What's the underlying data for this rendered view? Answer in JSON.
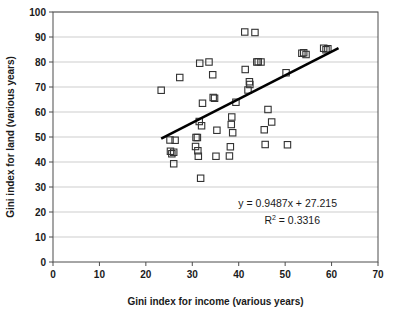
{
  "chart_data": {
    "type": "scatter",
    "title": "",
    "xlabel": "Gini index for income (various years)",
    "ylabel": "Gini index for land (various years)",
    "xlim": [
      0,
      70
    ],
    "ylim": [
      0,
      100
    ],
    "xticks": [
      0,
      10,
      20,
      30,
      40,
      50,
      60,
      70
    ],
    "yticks": [
      0,
      10,
      20,
      30,
      40,
      50,
      60,
      70,
      80,
      90,
      100
    ],
    "grid": "horizontal",
    "legend": "none",
    "marker": "open-square",
    "marker_color": "#333333",
    "trendline": {
      "type": "linear",
      "slope": 0.9487,
      "intercept": 27.215,
      "r_squared": 0.3316,
      "equation_label": "y = 0.9487x + 27.215",
      "r2_label_prefix": "R",
      "r2_label_sup": "2",
      "r2_label_value": " = 0.3316",
      "x_start": 23.3,
      "x_end": 61.5,
      "color": "#000000"
    },
    "points": [
      {
        "x": 23.3,
        "y": 68.7
      },
      {
        "x": 25.2,
        "y": 48.8
      },
      {
        "x": 25.3,
        "y": 44.3
      },
      {
        "x": 25.6,
        "y": 43.3
      },
      {
        "x": 26.0,
        "y": 43.9
      },
      {
        "x": 26.0,
        "y": 39.3
      },
      {
        "x": 26.3,
        "y": 48.7
      },
      {
        "x": 27.3,
        "y": 73.8
      },
      {
        "x": 30.7,
        "y": 46.2
      },
      {
        "x": 30.8,
        "y": 49.8
      },
      {
        "x": 31.1,
        "y": 49.8
      },
      {
        "x": 31.2,
        "y": 44.5
      },
      {
        "x": 31.3,
        "y": 42.3
      },
      {
        "x": 31.5,
        "y": 56.2
      },
      {
        "x": 31.6,
        "y": 79.5
      },
      {
        "x": 31.8,
        "y": 33.5
      },
      {
        "x": 32.0,
        "y": 54.5
      },
      {
        "x": 32.2,
        "y": 63.5
      },
      {
        "x": 33.6,
        "y": 80.0
      },
      {
        "x": 34.4,
        "y": 74.9
      },
      {
        "x": 34.5,
        "y": 65.8
      },
      {
        "x": 34.8,
        "y": 65.5
      },
      {
        "x": 35.1,
        "y": 42.3
      },
      {
        "x": 35.3,
        "y": 52.7
      },
      {
        "x": 38.0,
        "y": 42.4
      },
      {
        "x": 38.2,
        "y": 46.1
      },
      {
        "x": 38.4,
        "y": 55.0
      },
      {
        "x": 38.5,
        "y": 58.0
      },
      {
        "x": 38.7,
        "y": 51.7
      },
      {
        "x": 39.4,
        "y": 63.9
      },
      {
        "x": 41.3,
        "y": 92.0
      },
      {
        "x": 41.4,
        "y": 77.0
      },
      {
        "x": 42.0,
        "y": 68.8
      },
      {
        "x": 42.3,
        "y": 72.1
      },
      {
        "x": 42.4,
        "y": 71.0
      },
      {
        "x": 43.5,
        "y": 91.8
      },
      {
        "x": 43.9,
        "y": 80.0
      },
      {
        "x": 44.2,
        "y": 80.1
      },
      {
        "x": 44.8,
        "y": 80.0
      },
      {
        "x": 45.5,
        "y": 52.9
      },
      {
        "x": 45.7,
        "y": 47.0
      },
      {
        "x": 46.3,
        "y": 61.0
      },
      {
        "x": 47.1,
        "y": 56.0
      },
      {
        "x": 50.2,
        "y": 75.7
      },
      {
        "x": 50.5,
        "y": 46.9
      },
      {
        "x": 53.6,
        "y": 83.5
      },
      {
        "x": 54.0,
        "y": 83.7
      },
      {
        "x": 54.5,
        "y": 83.0
      },
      {
        "x": 58.3,
        "y": 85.5
      },
      {
        "x": 58.8,
        "y": 84.9
      },
      {
        "x": 59.2,
        "y": 85.3
      }
    ]
  }
}
